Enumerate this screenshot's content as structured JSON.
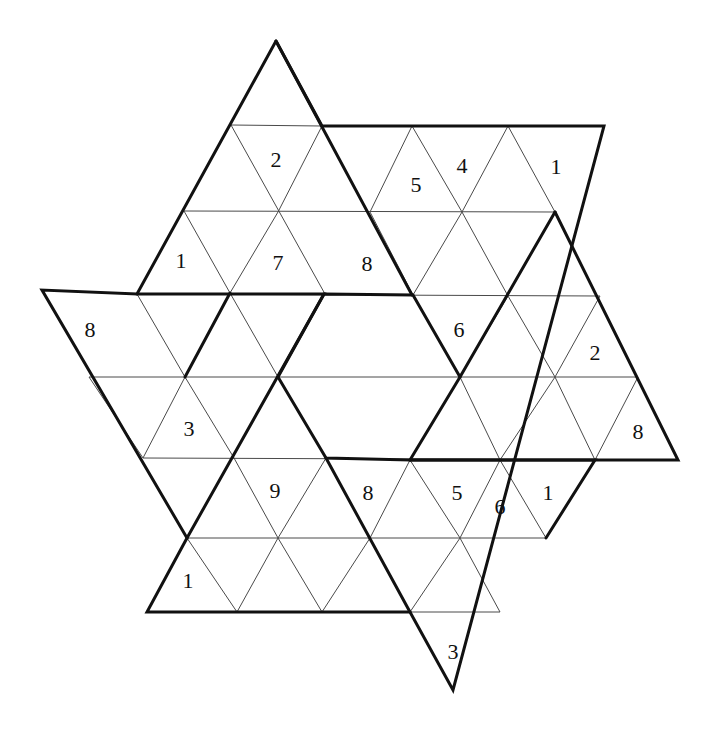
{
  "puzzle": {
    "type": "triangular-star-sudoku",
    "colors": {
      "thin_line": "#4a4a4a",
      "thick_line": "#111111",
      "background": "#ffffff",
      "digit": "#111111"
    },
    "clues": [
      {
        "value": "2",
        "x": 276,
        "y": 160
      },
      {
        "value": "5",
        "x": 416,
        "y": 185
      },
      {
        "value": "4",
        "x": 462,
        "y": 166
      },
      {
        "value": "1",
        "x": 556,
        "y": 167
      },
      {
        "value": "1",
        "x": 181,
        "y": 261
      },
      {
        "value": "7",
        "x": 278,
        "y": 263
      },
      {
        "value": "8",
        "x": 367,
        "y": 264
      },
      {
        "value": "8",
        "x": 90,
        "y": 330
      },
      {
        "value": "6",
        "x": 459,
        "y": 330
      },
      {
        "value": "2",
        "x": 595,
        "y": 353
      },
      {
        "value": "3",
        "x": 189,
        "y": 429
      },
      {
        "value": "8",
        "x": 638,
        "y": 432
      },
      {
        "value": "9",
        "x": 275,
        "y": 491
      },
      {
        "value": "8",
        "x": 368,
        "y": 493
      },
      {
        "value": "5",
        "x": 457,
        "y": 493
      },
      {
        "value": "6",
        "x": 500,
        "y": 507
      },
      {
        "value": "1",
        "x": 548,
        "y": 493
      },
      {
        "value": "1",
        "x": 188,
        "y": 581
      },
      {
        "value": "3",
        "x": 453,
        "y": 652
      }
    ],
    "thin_lines": [
      [
        231,
        125,
        322,
        126
      ],
      [
        184,
        211,
        555,
        212
      ],
      [
        137,
        294,
        600,
        296
      ],
      [
        42,
        290,
        137,
        294
      ],
      [
        89,
        377,
        638,
        377
      ],
      [
        143,
        458,
        678,
        460
      ],
      [
        187,
        538,
        546,
        538
      ],
      [
        322,
        612,
        500,
        612
      ],
      [
        231,
        125,
        325,
        294
      ],
      [
        322,
        126,
        278,
        212
      ],
      [
        184,
        211,
        230,
        293
      ],
      [
        278,
        212,
        230,
        293
      ],
      [
        370,
        212,
        413,
        295
      ],
      [
        412,
        126,
        370,
        212
      ],
      [
        412,
        126,
        462,
        212
      ],
      [
        508,
        126,
        462,
        212
      ],
      [
        508,
        126,
        555,
        212
      ],
      [
        462,
        212,
        413,
        295
      ],
      [
        462,
        212,
        508,
        296
      ],
      [
        137,
        294,
        185,
        377
      ],
      [
        230,
        293,
        185,
        377
      ],
      [
        230,
        293,
        278,
        377
      ],
      [
        89,
        377,
        143,
        458
      ],
      [
        185,
        377,
        143,
        458
      ],
      [
        185,
        377,
        234,
        458
      ],
      [
        555,
        377,
        508,
        296
      ],
      [
        508,
        296,
        460,
        377
      ],
      [
        555,
        377,
        600,
        296
      ],
      [
        555,
        377,
        500,
        460
      ],
      [
        555,
        377,
        595,
        460
      ],
      [
        460,
        377,
        500,
        460
      ],
      [
        638,
        377,
        595,
        460
      ],
      [
        234,
        458,
        278,
        538
      ],
      [
        326,
        458,
        278,
        538
      ],
      [
        410,
        460,
        370,
        538
      ],
      [
        410,
        460,
        460,
        538
      ],
      [
        500,
        460,
        460,
        538
      ],
      [
        500,
        460,
        546,
        538
      ],
      [
        595,
        460,
        546,
        538
      ],
      [
        187,
        538,
        237,
        612
      ],
      [
        278,
        538,
        237,
        612
      ],
      [
        278,
        538,
        322,
        612
      ],
      [
        370,
        538,
        322,
        612
      ],
      [
        370,
        538,
        410,
        612
      ],
      [
        460,
        538,
        410,
        612
      ],
      [
        460,
        538,
        500,
        612
      ]
    ],
    "thick_polylines": [
      [
        [
          276,
          41
        ],
        [
          137,
          294
        ],
        [
          42,
          290
        ],
        [
          187,
          538
        ],
        [
          147,
          612
        ],
        [
          410,
          612
        ],
        [
          453,
          690
        ],
        [
          604,
          126
        ],
        [
          322,
          126
        ],
        [
          276,
          41
        ]
      ],
      [
        [
          276,
          41
        ],
        [
          412,
          295
        ]
      ],
      [
        [
          137,
          294
        ],
        [
          324,
          294
        ],
        [
          187,
          538
        ]
      ],
      [
        [
          324,
          294
        ],
        [
          413,
          295
        ],
        [
          460,
          377
        ],
        [
          410,
          460
        ],
        [
          326,
          458
        ],
        [
          278,
          377
        ],
        [
          324,
          294
        ]
      ],
      [
        [
          555,
          212
        ],
        [
          678,
          460
        ],
        [
          410,
          460
        ]
      ],
      [
        [
          326,
          458
        ],
        [
          410,
          612
        ]
      ],
      [
        [
          555,
          212
        ],
        [
          460,
          377
        ]
      ],
      [
        [
          230,
          293
        ],
        [
          185,
          377
        ]
      ],
      [
        [
          410,
          460
        ],
        [
          595,
          460
        ],
        [
          546,
          538
        ]
      ]
    ]
  }
}
